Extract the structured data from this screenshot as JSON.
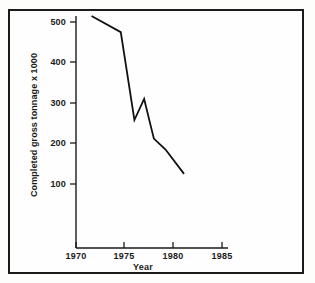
{
  "chart_data": {
    "type": "line",
    "title": "",
    "xlabel": "Year",
    "ylabel": "Completed  gross tonnage x 1000",
    "xlim": [
      1970,
      1986
    ],
    "ylim": [
      0,
      540
    ],
    "xticks": [
      "1970",
      "1975",
      "1980",
      "1985"
    ],
    "xtick_values": [
      1970,
      1975,
      1980,
      1985
    ],
    "yticks": [
      "100",
      "200",
      "300",
      "400",
      "500"
    ],
    "ytick_values": [
      100,
      200,
      300,
      400,
      500
    ],
    "grid": false,
    "legend": "none",
    "series": [
      {
        "name": "Completed gross tonnage",
        "x": [
          1971.6,
          1974.6,
          1976.0,
          1977.0,
          1978.0,
          1979.2,
          1981.1
        ],
        "values": [
          515,
          475,
          258,
          310,
          212,
          185,
          125
        ]
      }
    ],
    "line_color": "#111111",
    "axis_color": "#1a1a1a",
    "frame_color": "#1b1b1b",
    "background": "#fefefe"
  },
  "axis": {
    "x_title": "Year",
    "y_title": "Completed  gross tonnage x 1000",
    "x_tick_labels": [
      "1970",
      "1975",
      "1980",
      "1985"
    ],
    "y_tick_labels": [
      "500",
      "400",
      "300",
      "200",
      "100"
    ]
  }
}
